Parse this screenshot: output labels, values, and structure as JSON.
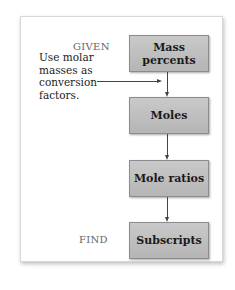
{
  "diagram": {
    "given_label": "GIVEN",
    "find_label": "FIND",
    "note": "Use molar masses as conversion factors.",
    "steps": [
      {
        "label": "Mass percents"
      },
      {
        "label": "Moles"
      },
      {
        "label": "Mole ratios"
      },
      {
        "label": "Subscripts"
      }
    ],
    "colors": {
      "box_fill": "#c0c0c0",
      "box_border": "#8c8c8c",
      "arrow": "#444444",
      "label_gray": "#666666"
    }
  }
}
